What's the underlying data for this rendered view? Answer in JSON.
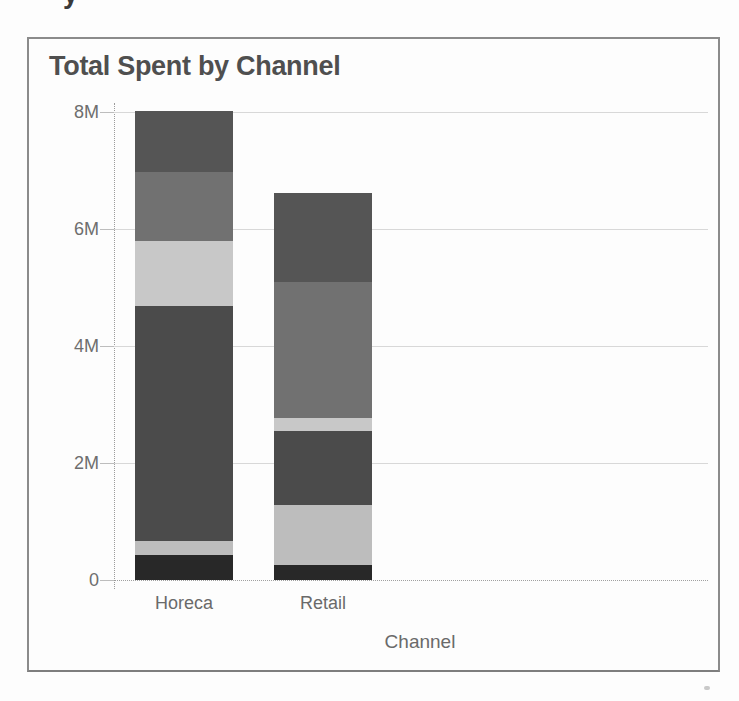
{
  "page": {
    "clipped_text_fragment": "y"
  },
  "chart": {
    "container_border_color": "#8b8b8b",
    "background": "#fdfdfd",
    "gridline_color": "#d8d8d8",
    "title_color": "#4f4f4f",
    "axis_text_color": "#6a6a6a"
  },
  "chart_data": {
    "type": "bar",
    "stacked": true,
    "title": "Total Spent by Channel",
    "xlabel": "Channel",
    "ylabel": "",
    "categories": [
      "Horeca",
      "Retail"
    ],
    "value_unit": "millions",
    "ylim": [
      0,
      8.2
    ],
    "grid": true,
    "legend_position": "none",
    "y_ticks": [
      {
        "label": "0",
        "value": 0
      },
      {
        "label": "2M",
        "value": 2
      },
      {
        "label": "4M",
        "value": 4
      },
      {
        "label": "6M",
        "value": 6
      },
      {
        "label": "8M",
        "value": 8
      }
    ],
    "stack_order": "bottom-to-top",
    "series": [
      {
        "name": "segment-1",
        "color": "#282828",
        "values": [
          0.42,
          0.25
        ]
      },
      {
        "name": "segment-2",
        "color": "#bdbdbd",
        "values": [
          0.24,
          1.03
        ]
      },
      {
        "name": "segment-3",
        "color": "#4b4b4b",
        "values": [
          4.02,
          1.26
        ]
      },
      {
        "name": "segment-4",
        "color": "#c8c8c8",
        "values": [
          1.12,
          0.23
        ]
      },
      {
        "name": "segment-5",
        "color": "#717171",
        "values": [
          1.18,
          2.32
        ]
      },
      {
        "name": "segment-6",
        "color": "#555555",
        "values": [
          1.03,
          1.52
        ]
      }
    ],
    "totals": [
      8.0,
      6.62
    ]
  }
}
